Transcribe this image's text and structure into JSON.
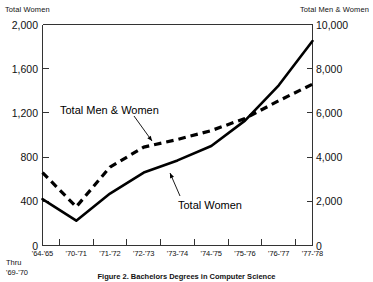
{
  "chart_data": {
    "type": "line",
    "title": "Figure 2.  Bachelors Degrees in Computer Science",
    "left_axis_title": "Total Women",
    "right_axis_title": "Total Men & Women",
    "xlabel": "",
    "categories": [
      "'64-'65",
      "'70-'71",
      "'71-'72",
      "'72-'73",
      "'73-'74",
      "'74-'75",
      "'75-'76",
      "'76-'77",
      "'77-'78"
    ],
    "x_note": "Thru\n'69-'70",
    "x_note_lines": [
      "Thru",
      "'69-'70"
    ],
    "left_ylim": [
      0,
      2000
    ],
    "right_ylim": [
      0,
      10000
    ],
    "left_ticks": [
      "0",
      "400",
      "800",
      "1,200",
      "1,600",
      "2,000"
    ],
    "left_tick_values": [
      0,
      400,
      800,
      1200,
      1600,
      2000
    ],
    "right_ticks": [
      "0",
      "2,000",
      "4,000",
      "6,000",
      "8,000",
      "10,000"
    ],
    "right_tick_values": [
      0,
      2000,
      4000,
      6000,
      8000,
      10000
    ],
    "grid": false,
    "legend": "inline-annotations",
    "series": [
      {
        "name": "Total Men & Women",
        "axis": "right",
        "style": "dashed",
        "values": [
          3300,
          1750,
          3550,
          4450,
          4800,
          5200,
          5750,
          6550,
          7300
        ]
      },
      {
        "name": "Total Women",
        "axis": "left",
        "style": "solid",
        "values": [
          420,
          225,
          470,
          660,
          770,
          900,
          1130,
          1450,
          1850
        ]
      }
    ],
    "annotations": [
      {
        "text": "Total Men & Women",
        "points_to_series": "Total Men & Women"
      },
      {
        "text": "Total Women",
        "points_to_series": "Total Women"
      }
    ]
  },
  "colors": {
    "ink": "#000000",
    "axis": "#333333",
    "background": "#ffffff"
  }
}
